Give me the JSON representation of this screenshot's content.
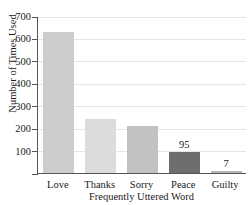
{
  "chart_data": {
    "type": "bar",
    "title": "of Death-Row Inmates",
    "xlabel": "Frequently Uttered Word",
    "ylabel": "Number of Times Used",
    "categories": [
      "Love",
      "Thanks",
      "Sorry",
      "Peace",
      "Guilty"
    ],
    "values": [
      627,
      240,
      208,
      95,
      7
    ],
    "point_labels": [
      "",
      "",
      "",
      "95",
      "7"
    ],
    "bar_colors": [
      "#cdcdcd",
      "#dcdcdc",
      "#c2c2c2",
      "#6e6e6e",
      "#b5b5b5"
    ],
    "ylim": [
      0,
      700
    ],
    "yticks": [
      0,
      100,
      200,
      300,
      400,
      500,
      600,
      700
    ],
    "ytick_labels": [
      "",
      "100",
      "200",
      "300",
      "400",
      "500",
      "600",
      "700"
    ],
    "grid": true,
    "legend": "none"
  }
}
